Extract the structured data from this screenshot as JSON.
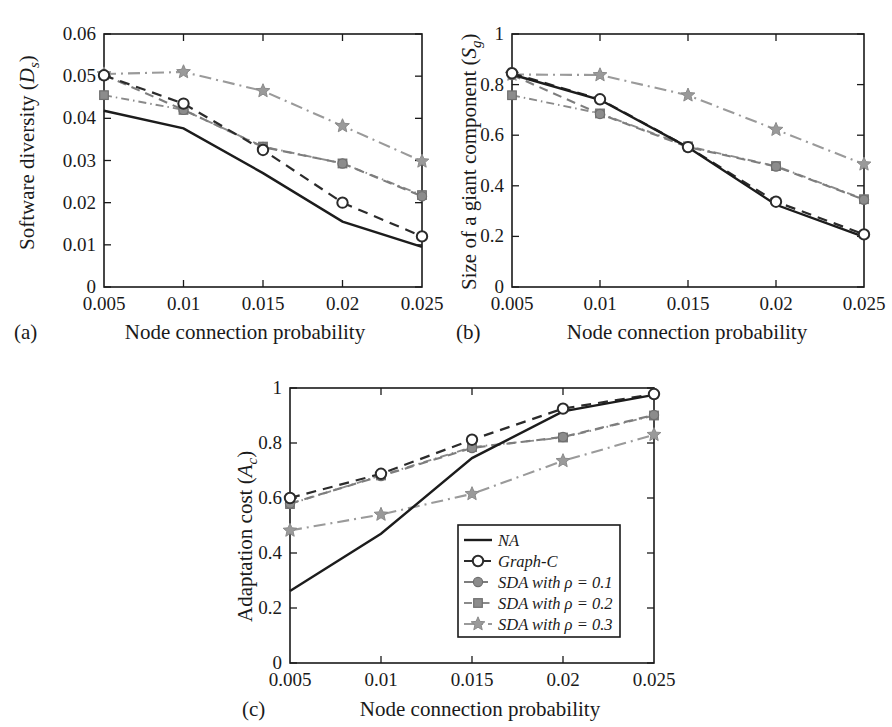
{
  "figure": {
    "panels": [
      {
        "letter": "(a)",
        "ylabel_main": "Software diversity (",
        "ylabel_var": "D",
        "ylabel_sub": "s",
        "ylabel_close": ")",
        "xlabel": "Node connection probability"
      },
      {
        "letter": "(b)",
        "ylabel_main": "Size of a giant component (",
        "ylabel_var": "S",
        "ylabel_sub": "g",
        "ylabel_close": ")",
        "xlabel": "Node connection probability"
      },
      {
        "letter": "(c)",
        "ylabel_main": "Adaptation cost (",
        "ylabel_var": "A",
        "ylabel_sub": "c",
        "ylabel_close": ")",
        "xlabel": "Node connection probability"
      }
    ]
  },
  "legend": {
    "entries": [
      {
        "label": "NA",
        "style": "solid",
        "marker": "none",
        "color": "#1c1c1c"
      },
      {
        "label": "Graph-C",
        "style": "dashed",
        "marker": "circle",
        "color": "#2b2b2b"
      },
      {
        "label": "SDA with ρ = 0.1",
        "style": "dashed",
        "marker": "dot",
        "color": "#7d7d7d"
      },
      {
        "label": "SDA with ρ = 0.2",
        "style": "dotted",
        "marker": "square",
        "color": "#8a8a8a"
      },
      {
        "label": "SDA with ρ = 0.3",
        "style": "dashdot",
        "marker": "star",
        "color": "#9a9a9a"
      }
    ]
  },
  "chart_data": [
    {
      "type": "line",
      "panel": "(a)",
      "title": "",
      "xlabel": "Node connection probability",
      "ylabel": "Software diversity (D_s)",
      "x": [
        0.005,
        0.01,
        0.015,
        0.02,
        0.025
      ],
      "xticklabels": [
        "0.005",
        "0.01",
        "0.015",
        "0.02",
        "0.025"
      ],
      "yticklabels": [
        "0",
        "0.01",
        "0.02",
        "0.03",
        "0.04",
        "0.05",
        "0.06"
      ],
      "yticks": [
        0,
        0.01,
        0.02,
        0.03,
        0.04,
        0.05,
        0.06
      ],
      "xlim": [
        0.005,
        0.025
      ],
      "ylim": [
        0,
        0.06
      ],
      "grid": false,
      "series": [
        {
          "name": "NA",
          "values": [
            0.0418,
            0.0376,
            0.027,
            0.0155,
            0.0095
          ]
        },
        {
          "name": "Graph-C",
          "values": [
            0.0502,
            0.0435,
            0.0325,
            0.02,
            0.012
          ]
        },
        {
          "name": "SDA with ρ = 0.1",
          "values": [
            0.0503,
            0.042,
            0.0332,
            0.0293,
            0.0215
          ]
        },
        {
          "name": "SDA with ρ = 0.2",
          "values": [
            0.0455,
            0.042,
            0.0333,
            0.0293,
            0.0218
          ]
        },
        {
          "name": "SDA with ρ = 0.3",
          "values": [
            0.0505,
            0.051,
            0.0465,
            0.0382,
            0.0298
          ]
        }
      ]
    },
    {
      "type": "line",
      "panel": "(b)",
      "title": "",
      "xlabel": "Node connection probability",
      "ylabel": "Size of a giant component (S_g)",
      "x": [
        0.005,
        0.01,
        0.015,
        0.02,
        0.025
      ],
      "xticklabels": [
        "0.005",
        "0.01",
        "0.015",
        "0.02",
        "0.025"
      ],
      "yticklabels": [
        "0",
        "0.2",
        "0.4",
        "0.6",
        "0.8",
        "1"
      ],
      "yticks": [
        0,
        0.2,
        0.4,
        0.6,
        0.8,
        1
      ],
      "xlim": [
        0.005,
        0.025
      ],
      "ylim": [
        0,
        1
      ],
      "grid": false,
      "series": [
        {
          "name": "NA",
          "values": [
            0.84,
            0.74,
            0.552,
            0.325,
            0.198
          ]
        },
        {
          "name": "Graph-C",
          "values": [
            0.845,
            0.742,
            0.553,
            0.337,
            0.208
          ]
        },
        {
          "name": "SDA with ρ = 0.1",
          "values": [
            0.838,
            0.684,
            0.553,
            0.476,
            0.345
          ]
        },
        {
          "name": "SDA with ρ = 0.2",
          "values": [
            0.758,
            0.686,
            0.556,
            0.478,
            0.347
          ]
        },
        {
          "name": "SDA with ρ = 0.3",
          "values": [
            0.84,
            0.838,
            0.758,
            0.622,
            0.485
          ]
        }
      ]
    },
    {
      "type": "line",
      "panel": "(c)",
      "title": "",
      "xlabel": "Node connection probability",
      "ylabel": "Adaptation cost (A_c)",
      "x": [
        0.005,
        0.01,
        0.015,
        0.02,
        0.025
      ],
      "xticklabels": [
        "0.005",
        "0.01",
        "0.015",
        "0.02",
        "0.025"
      ],
      "yticklabels": [
        "0",
        "0.2",
        "0.4",
        "0.6",
        "0.8",
        "1"
      ],
      "yticks": [
        0,
        0.2,
        0.4,
        0.6,
        0.8,
        1
      ],
      "xlim": [
        0.005,
        0.025
      ],
      "ylim": [
        0,
        1
      ],
      "grid": false,
      "series": [
        {
          "name": "NA",
          "values": [
            0.262,
            0.47,
            0.745,
            0.915,
            0.975
          ]
        },
        {
          "name": "Graph-C",
          "values": [
            0.6,
            0.688,
            0.812,
            0.925,
            0.978
          ]
        },
        {
          "name": "SDA with ρ = 0.1",
          "values": [
            0.58,
            0.68,
            0.782,
            0.822,
            0.902
          ]
        },
        {
          "name": "SDA with ρ = 0.2",
          "values": [
            0.578,
            0.682,
            0.785,
            0.82,
            0.9
          ]
        },
        {
          "name": "SDA with ρ = 0.3",
          "values": [
            0.482,
            0.54,
            0.615,
            0.735,
            0.83
          ]
        }
      ]
    }
  ]
}
